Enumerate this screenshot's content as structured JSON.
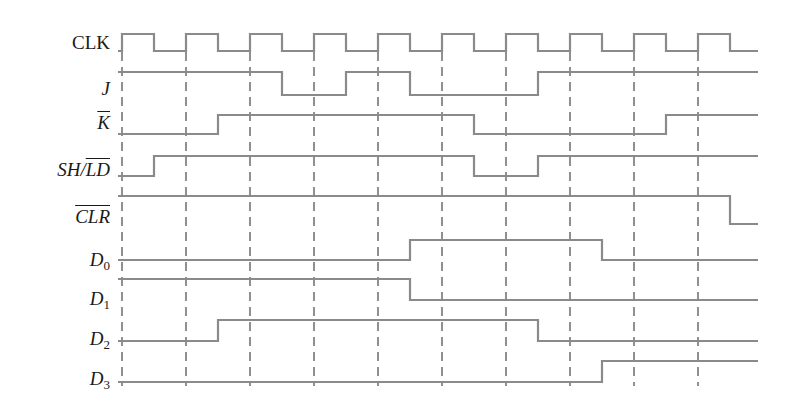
{
  "diagram": {
    "colors": {
      "waveform": "#8a8a8a",
      "dashed": "#555555",
      "text": "#1a1a1a",
      "background": "#ffffff"
    },
    "clock_rising_edges_x": [
      122,
      186,
      250,
      314,
      378,
      442,
      506,
      570,
      634,
      698
    ],
    "x_start": 118,
    "x_end": 758,
    "dashed_top": 52,
    "dashed_bottom": 386,
    "signals": [
      {
        "name": "CLK",
        "label": "CLK",
        "italic": false,
        "overline": false,
        "subscript": "",
        "label_y": 33,
        "y_high": 34,
        "y_low": 51,
        "transitions": [
          [
            118,
            0
          ],
          [
            122,
            1
          ],
          [
            154,
            0
          ],
          [
            186,
            1
          ],
          [
            218,
            0
          ],
          [
            250,
            1
          ],
          [
            282,
            0
          ],
          [
            314,
            1
          ],
          [
            346,
            0
          ],
          [
            378,
            1
          ],
          [
            410,
            0
          ],
          [
            442,
            1
          ],
          [
            474,
            0
          ],
          [
            506,
            1
          ],
          [
            538,
            0
          ],
          [
            570,
            1
          ],
          [
            602,
            0
          ],
          [
            634,
            1
          ],
          [
            666,
            0
          ],
          [
            698,
            1
          ],
          [
            730,
            0
          ],
          [
            758,
            0
          ]
        ]
      },
      {
        "name": "J",
        "label": "J",
        "italic": true,
        "overline": false,
        "subscript": "",
        "label_y": 79,
        "y_high": 72,
        "y_low": 95,
        "transitions": [
          [
            118,
            1
          ],
          [
            282,
            0
          ],
          [
            346,
            1
          ],
          [
            410,
            0
          ],
          [
            538,
            1
          ],
          [
            758,
            1
          ]
        ]
      },
      {
        "name": "K_bar",
        "label": "K",
        "italic": true,
        "overline": true,
        "subscript": "",
        "label_y": 113,
        "y_high": 115,
        "y_low": 134,
        "transitions": [
          [
            118,
            0
          ],
          [
            218,
            1
          ],
          [
            474,
            0
          ],
          [
            666,
            1
          ],
          [
            758,
            1
          ]
        ]
      },
      {
        "name": "SH_LD_bar",
        "label_prefix": "SH/",
        "label": "LD",
        "italic": true,
        "overline": true,
        "subscript": "",
        "label_y": 160,
        "y_high": 156,
        "y_low": 176,
        "transitions": [
          [
            118,
            0
          ],
          [
            154,
            1
          ],
          [
            474,
            0
          ],
          [
            538,
            1
          ],
          [
            758,
            1
          ]
        ]
      },
      {
        "name": "CLR_bar",
        "label": "CLR",
        "italic": true,
        "overline": true,
        "subscript": "",
        "label_y": 207,
        "y_high": 196,
        "y_low": 224,
        "transitions": [
          [
            118,
            1
          ],
          [
            730,
            0
          ],
          [
            758,
            0
          ]
        ]
      },
      {
        "name": "D0",
        "label": "D",
        "italic": true,
        "overline": false,
        "subscript": "0",
        "label_y": 250,
        "y_high": 240,
        "y_low": 260,
        "transitions": [
          [
            118,
            0
          ],
          [
            410,
            1
          ],
          [
            602,
            0
          ],
          [
            758,
            0
          ]
        ]
      },
      {
        "name": "D1",
        "label": "D",
        "italic": true,
        "overline": false,
        "subscript": "1",
        "label_y": 289,
        "y_high": 279,
        "y_low": 300,
        "transitions": [
          [
            118,
            1
          ],
          [
            410,
            0
          ],
          [
            758,
            0
          ]
        ]
      },
      {
        "name": "D2",
        "label": "D",
        "italic": true,
        "overline": false,
        "subscript": "2",
        "label_y": 329,
        "y_high": 320,
        "y_low": 341,
        "transitions": [
          [
            118,
            0
          ],
          [
            218,
            1
          ],
          [
            538,
            0
          ],
          [
            758,
            0
          ]
        ]
      },
      {
        "name": "D3",
        "label": "D",
        "italic": true,
        "overline": false,
        "subscript": "3",
        "label_y": 369,
        "y_high": 361,
        "y_low": 382,
        "transitions": [
          [
            118,
            0
          ],
          [
            602,
            1
          ],
          [
            758,
            1
          ]
        ]
      }
    ]
  }
}
